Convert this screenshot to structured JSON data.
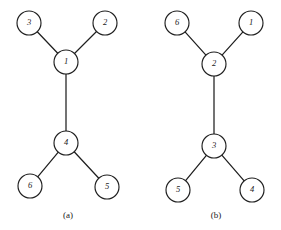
{
  "figure": {
    "background_color": "#ffffff",
    "stroke_color": "#1f1f1f",
    "node_fill_color": "#ffffff",
    "node_radius": 12,
    "panels": [
      {
        "id": "panel-a",
        "caption": "(a)",
        "caption_x": 68,
        "caption_y": 216,
        "nodes": [
          {
            "id": "a-n3",
            "label": "3",
            "cx": 29,
            "cy": 23
          },
          {
            "id": "a-n2",
            "label": "2",
            "cx": 105,
            "cy": 23
          },
          {
            "id": "a-n1",
            "label": "1",
            "cx": 66,
            "cy": 62
          },
          {
            "id": "a-n4",
            "label": "4",
            "cx": 66,
            "cy": 143
          },
          {
            "id": "a-n6",
            "label": "6",
            "cx": 30,
            "cy": 186
          },
          {
            "id": "a-n5",
            "label": "5",
            "cx": 107,
            "cy": 187
          }
        ],
        "edges": [
          {
            "id": "a-e-3-1",
            "from": "a-n3",
            "to": "a-n1"
          },
          {
            "id": "a-e-2-1",
            "from": "a-n2",
            "to": "a-n1"
          },
          {
            "id": "a-e-1-4",
            "from": "a-n1",
            "to": "a-n4"
          },
          {
            "id": "a-e-4-6",
            "from": "a-n4",
            "to": "a-n6"
          },
          {
            "id": "a-e-4-5",
            "from": "a-n4",
            "to": "a-n5"
          }
        ]
      },
      {
        "id": "panel-b",
        "caption": "(b)",
        "caption_x": 216,
        "caption_y": 216,
        "nodes": [
          {
            "id": "b-n6",
            "label": "6",
            "cx": 177,
            "cy": 23
          },
          {
            "id": "b-n1",
            "label": "1",
            "cx": 251,
            "cy": 23
          },
          {
            "id": "b-n2",
            "label": "2",
            "cx": 214,
            "cy": 64
          },
          {
            "id": "b-n3",
            "label": "3",
            "cx": 214,
            "cy": 146
          },
          {
            "id": "b-n5",
            "label": "5",
            "cx": 178,
            "cy": 190
          },
          {
            "id": "b-n4",
            "label": "4",
            "cx": 252,
            "cy": 190
          }
        ],
        "edges": [
          {
            "id": "b-e-6-2",
            "from": "b-n6",
            "to": "b-n2"
          },
          {
            "id": "b-e-1-2",
            "from": "b-n1",
            "to": "b-n2"
          },
          {
            "id": "b-e-2-3",
            "from": "b-n2",
            "to": "b-n3"
          },
          {
            "id": "b-e-3-5",
            "from": "b-n3",
            "to": "b-n5"
          },
          {
            "id": "b-e-3-4",
            "from": "b-n3",
            "to": "b-n4"
          }
        ]
      }
    ]
  }
}
